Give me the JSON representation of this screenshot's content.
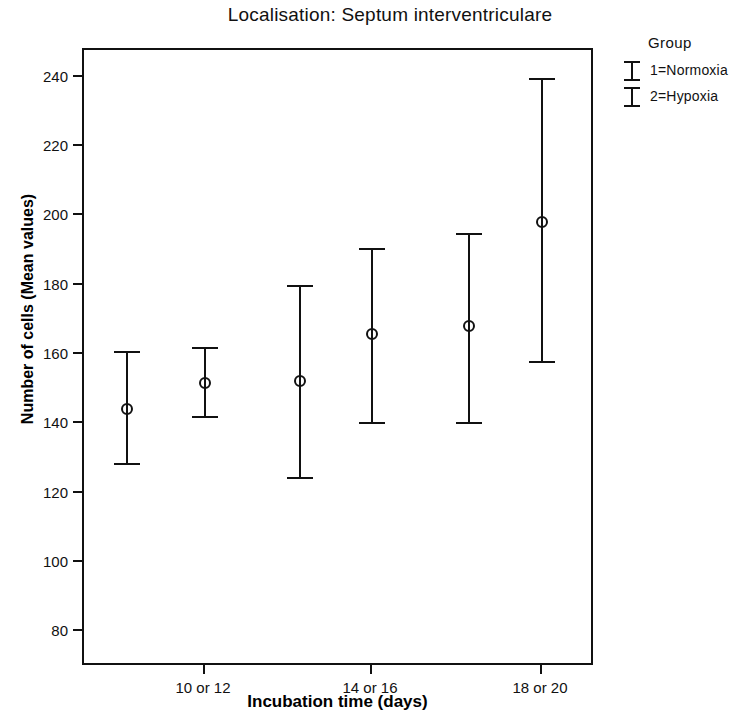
{
  "chart_data": {
    "type": "scatter",
    "title": "Localisation: Septum interventriculare",
    "xlabel": "Incubation time (days)",
    "ylabel": "Number of cells (Mean values)",
    "categories": [
      "10 or 12",
      "14 or 16",
      "18 or 20"
    ],
    "ylim": [
      70,
      248
    ],
    "yticks": [
      80,
      100,
      120,
      140,
      160,
      180,
      200,
      220,
      240
    ],
    "grid": false,
    "legend_position": "right-top",
    "legend_title": "Group",
    "series": [
      {
        "name": "1=Normoxia",
        "values": [
          144.5,
          152.5,
          168.5
        ],
        "upper": [
          161.0,
          180.0,
          195.0
        ],
        "lower": [
          128.5,
          124.5,
          140.5
        ]
      },
      {
        "name": "2=Hypoxia",
        "values": [
          152.0,
          166.0,
          198.5
        ],
        "upper": [
          162.0,
          190.5,
          239.5
        ],
        "lower": [
          142.0,
          140.5,
          158.0
        ]
      }
    ],
    "points": [
      {
        "group": "10 or 12",
        "series": "1=Normoxia",
        "mean": 144.5,
        "upper": 161.0,
        "lower": 128.5,
        "x_px": 125
      },
      {
        "group": "10 or 12",
        "series": "2=Hypoxia",
        "mean": 152.0,
        "upper": 162.0,
        "lower": 142.0,
        "x_px": 203
      },
      {
        "group": "14 or 16",
        "series": "1=Normoxia",
        "mean": 152.5,
        "upper": 180.0,
        "lower": 124.5,
        "x_px": 298
      },
      {
        "group": "14 or 16",
        "series": "2=Hypoxia",
        "mean": 166.0,
        "upper": 190.5,
        "lower": 140.5,
        "x_px": 370
      },
      {
        "group": "18 or 20",
        "series": "1=Normoxia",
        "mean": 168.5,
        "upper": 195.0,
        "lower": 140.5,
        "x_px": 467
      },
      {
        "group": "18 or 20",
        "series": "2=Hypoxia",
        "mean": 198.5,
        "upper": 239.5,
        "lower": 158.0,
        "x_px": 540
      }
    ],
    "x_tick_px": [
      203,
      370,
      540
    ]
  },
  "legend": {
    "title": "Group",
    "entries": [
      {
        "label": "1=Normoxia"
      },
      {
        "label": "2=Hypoxia"
      }
    ]
  },
  "colors": {
    "foreground": "#111111",
    "background": "#ffffff"
  }
}
